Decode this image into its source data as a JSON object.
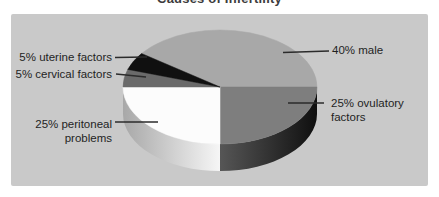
{
  "figure": {
    "title": "Causes of Infertility"
  },
  "chart_data": {
    "type": "pie",
    "style": "3d",
    "title": "Causes of Infertility",
    "start_angle_deg": 144,
    "direction": "clockwise",
    "legend": "none",
    "slices": [
      {
        "name": "male",
        "label": "40% male",
        "value": 40,
        "percent": "40%",
        "color": "#a8a8a8"
      },
      {
        "name": "ovulatory-factors",
        "label": "25% ovulatory factors",
        "value": 25,
        "percent": "25%",
        "color": "#7e7e7e",
        "side_left": "#565656",
        "side_right": "#0f0f0f"
      },
      {
        "name": "peritoneal-problems",
        "label": "25% peritoneal problems",
        "value": 25,
        "percent": "25%",
        "color": "#fcfcfc",
        "side_left": "#a8a8a8",
        "side_right": "#f6f6f6"
      },
      {
        "name": "cervical-factors",
        "label": "5% cervical factors",
        "value": 5,
        "percent": "5%",
        "color": "#6a6a6a"
      },
      {
        "name": "uterine-factors",
        "label": "5% uterine factors",
        "value": 5,
        "percent": "5%",
        "color": "#101010"
      }
    ]
  },
  "callouts": {
    "uterine": {
      "text": "5% uterine factors"
    },
    "cervical": {
      "text": "5% cervical factors"
    },
    "peritoneal": {
      "line1": "25% peritoneal",
      "line2": "problems"
    },
    "male": {
      "text": "40% male"
    },
    "ovulatory": {
      "line1": "25% ovulatory",
      "line2": "factors"
    }
  },
  "colors": {
    "page_bg": "#ffffff",
    "panel_bg": "#c9c9c9",
    "label_text": "#1f1f1f",
    "leader_line": "#2b2b2b",
    "title_text": "#3c3c3c"
  }
}
